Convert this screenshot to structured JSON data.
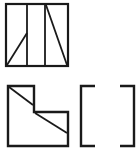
{
  "canvas": {
    "width": 140,
    "height": 162,
    "background_color": "#ffffff",
    "stroke_color": "#1a1a1a"
  },
  "figures": [
    {
      "id": "top-view-panel",
      "name": "top-view-square",
      "description": "Square outline divided into three vertical bays by two internal vertical lines, with a diagonal in the left bay and a diagonal in the right bay",
      "outline": {
        "x": 6,
        "y": 4,
        "width": 62,
        "height": 62,
        "stroke_width": 2.2
      },
      "internal_lines": [
        {
          "name": "vertical-divider-left",
          "x1": 27,
          "y1": 4,
          "x2": 27,
          "y2": 66,
          "stroke_width": 1.8
        },
        {
          "name": "vertical-divider-right",
          "x1": 45,
          "y1": 4,
          "x2": 45,
          "y2": 66,
          "stroke_width": 1.8
        },
        {
          "name": "diagonal-left-bay",
          "x1": 7,
          "y1": 65,
          "x2": 27,
          "y2": 33,
          "stroke_width": 1.8
        },
        {
          "name": "diagonal-right-bay",
          "x1": 46,
          "y1": 5,
          "x2": 67,
          "y2": 65,
          "stroke_width": 1.8
        }
      ]
    },
    {
      "id": "front-view-panel",
      "name": "front-view-l-shape",
      "description": "L-shaped (stepped) outline with a diagonal across the upper-left arm and a diagonal across the lower-right arm",
      "outline_points": "8,86 34,86 34,112 68,112 68,146 8,146",
      "stroke_width": 2.4,
      "internal_lines": [
        {
          "name": "diagonal-upper-arm",
          "x1": 9,
          "y1": 87,
          "x2": 33,
          "y2": 105,
          "stroke_width": 1.8
        },
        {
          "name": "diagonal-lower-arm",
          "x1": 35,
          "y1": 113,
          "x2": 67,
          "y2": 133,
          "stroke_width": 1.8
        }
      ]
    },
    {
      "id": "left-bracket-mark",
      "name": "left-bracket",
      "description": "Open square bracket mark",
      "points": "95,86 81,86 81,146 95,146",
      "stroke_width": 2.4
    },
    {
      "id": "right-bracket-mark",
      "name": "right-bracket",
      "description": "Close square bracket mark",
      "points": "120,86 134,86 134,146 120,146",
      "stroke_width": 2.4
    }
  ]
}
